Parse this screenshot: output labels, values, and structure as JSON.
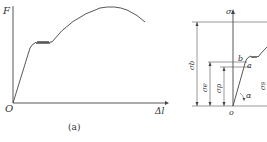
{
  "figure_a": {
    "y_axis_label": "F",
    "x_axis_label": "Δl",
    "origin_label": "O",
    "caption": "(a)"
  },
  "figure_b": {
    "y_axis_label": "σ",
    "origin_label": "o",
    "point_b": "b",
    "point_a": "a",
    "angle_label": "α",
    "dim_sigma_b": "σb",
    "dim_sigma_e": "σe",
    "dim_sigma_p": "σp",
    "dim_sigma_s": "σs"
  }
}
